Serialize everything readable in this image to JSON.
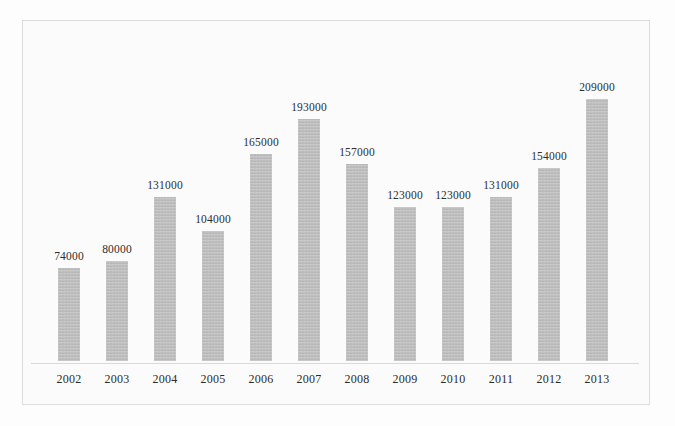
{
  "chart_data": {
    "type": "bar",
    "title": "",
    "subtitle": "",
    "xlabel": "",
    "ylabel": "",
    "categories": [
      "2002",
      "2003",
      "2004",
      "2005",
      "2006",
      "2007",
      "2008",
      "2009",
      "2010",
      "2011",
      "2012",
      "2013"
    ],
    "values": [
      74000,
      80000,
      131000,
      104000,
      165000,
      193000,
      157000,
      123000,
      123000,
      131000,
      154000,
      209000
    ],
    "data_labels": [
      "74000",
      "80000",
      "131000",
      "104000",
      "165000",
      "193000",
      "157000",
      "123000",
      "123000",
      "131000",
      "154000",
      "209000"
    ],
    "ylim": [
      0,
      209000
    ],
    "grid": false,
    "legend": null,
    "legend_position": "none",
    "axis_ticks_visible": false,
    "points": [
      {
        "category": "2002",
        "value": 74000,
        "label": "74000"
      },
      {
        "category": "2003",
        "value": 80000,
        "label": "80000"
      },
      {
        "category": "2004",
        "value": 131000,
        "label": "131000"
      },
      {
        "category": "2005",
        "value": 104000,
        "label": "104000"
      },
      {
        "category": "2006",
        "value": 165000,
        "label": "165000"
      },
      {
        "category": "2007",
        "value": 193000,
        "label": "193000"
      },
      {
        "category": "2008",
        "value": 157000,
        "label": "157000"
      },
      {
        "category": "2009",
        "value": 123000,
        "label": "123000"
      },
      {
        "category": "2010",
        "value": 123000,
        "label": "123000"
      },
      {
        "category": "2011",
        "value": 131000,
        "label": "131000"
      },
      {
        "category": "2012",
        "value": 154000,
        "label": "154000"
      },
      {
        "category": "2013",
        "value": 209000,
        "label": "209000"
      }
    ]
  },
  "style": {
    "bar_color": "#bcbcbc",
    "label_color": "#2e2e2e",
    "tick_color": "#2b2b2b",
    "axis_line_color": "#d9d9d9",
    "frame_border_color": "#dcdcdc",
    "plot_background": "#fbfbfb",
    "page_background": "#fdfdfd"
  },
  "geometry": {
    "bar_width_px": 22,
    "bar_pitch_px": 48,
    "first_bar_center_px": 46,
    "baseline_y_px": 342,
    "max_bar_height_px": 262,
    "label_gap_px": 6
  }
}
